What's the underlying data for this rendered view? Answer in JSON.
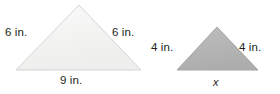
{
  "figure": {
    "background_color": "#ffffff",
    "text_color": "#231f20",
    "shapes": [
      {
        "name": "large-triangle",
        "fill": "#f2f2f1",
        "stroke": "#d2d2d2",
        "points": "79,5 141,70 16,70",
        "labels": {
          "left_side": "6 in.",
          "right_side": "6 in.",
          "base": "9 in."
        }
      },
      {
        "name": "small-triangle",
        "fill": "#b4b4b4",
        "stroke": "#9a9a9a",
        "points": "217,27 258,70 177,70",
        "labels": {
          "left_side": "4 in.",
          "right_side": "4 in.",
          "base": "x"
        }
      }
    ]
  },
  "chart_data": {
    "type": "diagram",
    "figures": [
      {
        "id": "large-triangle",
        "shape": "isosceles triangle",
        "fill_color": "#f2f2f1",
        "leg_left": "6 in.",
        "leg_right": "6 in.",
        "base": "9 in.",
        "leg_left_value": 6,
        "leg_right_value": 6,
        "base_value": 9,
        "unit": "in."
      },
      {
        "id": "small-triangle",
        "shape": "isosceles triangle",
        "fill_color": "#b4b4b4",
        "leg_left": "4 in.",
        "leg_right": "4 in.",
        "base": "x",
        "leg_left_value": 4,
        "leg_right_value": 4,
        "base_value": null,
        "unit": "in."
      }
    ]
  }
}
